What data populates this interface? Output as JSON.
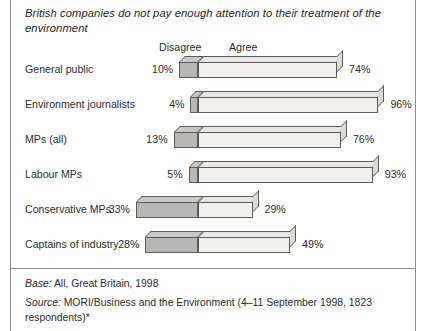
{
  "title": "British companies do not pay enough attention to their treatment of the environment",
  "legend": {
    "disagree": "Disagree",
    "agree": "Agree"
  },
  "footnotes": {
    "base_lead": "Base:",
    "base_text": " All, Great Britain, 1998",
    "source_lead": "Source:",
    "source_text": " MORI/Business and the Environment (4–11 September 1998, 1823 respondents)*"
  },
  "colors": {
    "disagree_fill": "#b9b7b1",
    "agree_fill": "#f1f0ec",
    "outline": "#5a5a5a",
    "text": "#2b2b2b",
    "rule": "#8d8d8d"
  },
  "chart_data": {
    "type": "bar",
    "orientation": "horizontal-diverging",
    "title": "British companies do not pay enough attention to their treatment of the environment",
    "xlabel": "",
    "ylabel": "",
    "grid": false,
    "legend_position": "top",
    "axis_origin_percent": 0,
    "categories": [
      "General public",
      "Environment journalists",
      "MPs (all)",
      "Labour MPs",
      "Conservative MPs",
      "Captains of industry"
    ],
    "series": [
      {
        "name": "Disagree",
        "values": [
          10,
          4,
          13,
          5,
          33,
          28
        ],
        "labels": [
          "10%",
          "4%",
          "13%",
          "5%",
          "33%",
          "29%"
        ]
      },
      {
        "name": "Agree",
        "values": [
          74,
          96,
          76,
          93,
          29,
          49
        ],
        "labels": [
          "74%",
          "96%",
          "76%",
          "93%",
          "29%",
          "49%"
        ]
      }
    ],
    "rows": [
      {
        "label": "General public",
        "disagree": 10,
        "agree": 74,
        "disagree_label": "10%",
        "agree_label": "74%"
      },
      {
        "label": "Environment journalists",
        "disagree": 4,
        "agree": 96,
        "disagree_label": "4%",
        "agree_label": "96%"
      },
      {
        "label": "MPs (all)",
        "disagree": 13,
        "agree": 76,
        "disagree_label": "13%",
        "agree_label": "76%"
      },
      {
        "label": "Labour MPs",
        "disagree": 5,
        "agree": 93,
        "disagree_label": "5%",
        "agree_label": "93%"
      },
      {
        "label": "Conservative MPs",
        "disagree": 33,
        "agree": 29,
        "disagree_label": "33%",
        "agree_label": "29%"
      },
      {
        "label": "Captains of industry",
        "disagree": 28,
        "agree": 49,
        "disagree_label": "28%",
        "agree_label": "49%"
      }
    ]
  }
}
